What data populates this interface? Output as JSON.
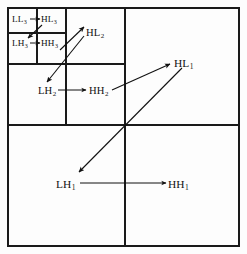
{
  "figure": {
    "kind": "wavelet-subband-scan-order",
    "frame": {
      "x": 8,
      "y": 8,
      "width": 231,
      "height": 238
    },
    "colors": {
      "background": "#fdfdfd",
      "line": "#1a1a1a",
      "text": "#111111",
      "arrow": "#111111"
    }
  },
  "grid": {
    "outer_border": {
      "x": 8,
      "y": 8,
      "width": 231,
      "height": 238,
      "stroke_width": 1.6
    },
    "level1_split": {
      "vertical_x": 125,
      "horizontal_y": 125,
      "stroke_width": 1.4
    },
    "level2_split": {
      "vertical_x": 66,
      "horizontal_y": 64,
      "stroke_width": 1.3
    },
    "level3_split": {
      "vertical_x": 37,
      "horizontal_y": 33,
      "stroke_width": 1.2
    }
  },
  "labels": [
    {
      "id": "ll3",
      "base": "LL",
      "sub": "3",
      "level": 3,
      "x": 12,
      "y": 15,
      "text": "LL3"
    },
    {
      "id": "hl3",
      "base": "HL",
      "sub": "3",
      "level": 3,
      "x": 41,
      "y": 15,
      "text": "HL3"
    },
    {
      "id": "lh3",
      "base": "LH",
      "sub": "3",
      "level": 3,
      "x": 12,
      "y": 39,
      "text": "LH3"
    },
    {
      "id": "hh3",
      "base": "HH",
      "sub": "3",
      "level": 3,
      "x": 41,
      "y": 39,
      "text": "HH3"
    },
    {
      "id": "hl2",
      "base": "HL",
      "sub": "2",
      "level": 2,
      "x": 86,
      "y": 28,
      "text": "HL2"
    },
    {
      "id": "lh2",
      "base": "LH",
      "sub": "2",
      "level": 2,
      "x": 38,
      "y": 86,
      "text": "LH2"
    },
    {
      "id": "hh2",
      "base": "HH",
      "sub": "2",
      "level": 2,
      "x": 89,
      "y": 86,
      "text": "HH2"
    },
    {
      "id": "hl1",
      "base": "HL",
      "sub": "1",
      "level": 1,
      "x": 174,
      "y": 58,
      "text": "HL1"
    },
    {
      "id": "lh1",
      "base": "LH",
      "sub": "1",
      "level": 1,
      "x": 56,
      "y": 179,
      "text": "LH1"
    },
    {
      "id": "hh1",
      "base": "HH",
      "sub": "1",
      "level": 1,
      "x": 168,
      "y": 179,
      "text": "HH1"
    }
  ],
  "arrows": [
    {
      "id": "ll3-to-hl3",
      "from": "ll3",
      "to": "hl3",
      "x1": 30,
      "y1": 19,
      "x2": 40,
      "y2": 19,
      "style": "straight"
    },
    {
      "id": "hl3-to-lh3",
      "from": "hl3",
      "to": "lh3",
      "x1": 42,
      "y1": 25,
      "x2": 28,
      "y2": 38,
      "style": "diagonal"
    },
    {
      "id": "lh3-to-hh3",
      "from": "lh3",
      "to": "hh3",
      "x1": 30,
      "y1": 43,
      "x2": 40,
      "y2": 43,
      "style": "straight"
    },
    {
      "id": "hh3-to-hl2",
      "from": "hh3",
      "to": "hl2",
      "x1": 60,
      "y1": 50,
      "x2": 84,
      "y2": 27,
      "style": "diagonal"
    },
    {
      "id": "hl2-to-lh2",
      "from": "hl2",
      "to": "lh2",
      "x1": 84,
      "y1": 36,
      "x2": 47,
      "y2": 82,
      "style": "diagonal"
    },
    {
      "id": "lh2-to-hh2",
      "from": "lh2",
      "to": "hh2",
      "x1": 58,
      "y1": 90,
      "x2": 86,
      "y2": 90,
      "style": "straight"
    },
    {
      "id": "hh2-to-hl1",
      "from": "hh2",
      "to": "hl1",
      "x1": 112,
      "y1": 90,
      "x2": 170,
      "y2": 64,
      "style": "diagonal"
    },
    {
      "id": "hl1-to-lh1",
      "from": "hl1",
      "to": "lh1",
      "x1": 182,
      "y1": 68,
      "x2": 79,
      "y2": 172,
      "style": "diagonal"
    },
    {
      "id": "lh1-to-hh1",
      "from": "lh1",
      "to": "hh1",
      "x1": 80,
      "y1": 183,
      "x2": 166,
      "y2": 183,
      "style": "straight"
    }
  ],
  "scan_order": [
    "LL3",
    "HL3",
    "LH3",
    "HH3",
    "HL2",
    "LH2",
    "HH2",
    "HL1",
    "LH1",
    "HH1"
  ]
}
